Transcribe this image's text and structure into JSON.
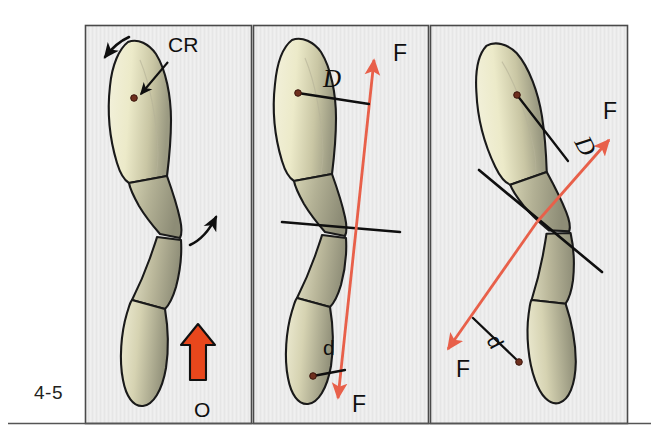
{
  "figure": {
    "number": "4-5",
    "background_color": "#ffffff",
    "panel_fill": "#ececec",
    "panel_border_color": "#4a4a4a",
    "rule_color": "#555555"
  },
  "colors": {
    "tooth_crown": "#ecead0",
    "tooth_shadow": "#9a9a82",
    "tooth_outline": "#1a1a1a",
    "force_arrow": "#e8604a",
    "occlusal_arrow": "#e8471c",
    "occlusal_arrow_outline": "#111111",
    "cr_dot": "#6e2f1e",
    "leader_line": "#111111",
    "axis_line": "#111111"
  },
  "panels": [
    {
      "id": "panel-1",
      "name": "panel-uprighting-moment",
      "labels": [
        {
          "key": "cr",
          "text": "CR",
          "style": "sans",
          "x": 168,
          "y": 52,
          "size": 21
        },
        {
          "key": "o",
          "text": "O",
          "style": "sans",
          "x": 194,
          "y": 417,
          "size": 21
        }
      ],
      "markers": [
        {
          "key": "cr-dot",
          "name": "center-of-resistance-dot",
          "x": 134,
          "y": 98
        }
      ],
      "arrows": [
        {
          "key": "rotation-top",
          "name": "rotation-arrow-top-left"
        },
        {
          "key": "rotation-bottom",
          "name": "rotation-arrow-bottom-right"
        },
        {
          "key": "occlusal-force",
          "name": "occlusal-force-arrow"
        }
      ]
    },
    {
      "id": "panel-2",
      "name": "panel-vertical-force",
      "labels": [
        {
          "key": "d-upper",
          "text": "D",
          "style": "serif-italic",
          "x": 323,
          "y": 87,
          "size": 25
        },
        {
          "key": "f-upper",
          "text": "F",
          "style": "sans",
          "x": 393,
          "y": 61,
          "size": 23
        },
        {
          "key": "d-lower",
          "text": "d",
          "style": "sans",
          "x": 323,
          "y": 355,
          "size": 21
        },
        {
          "key": "f-lower",
          "text": "F",
          "style": "sans",
          "x": 352,
          "y": 412,
          "size": 23
        }
      ],
      "markers": [
        {
          "key": "cr-dot-upper",
          "name": "center-of-resistance-dot-upper",
          "x": 298,
          "y": 93
        },
        {
          "key": "cr-dot-lower",
          "name": "center-of-resistance-dot-lower",
          "x": 313,
          "y": 376
        }
      ],
      "arrows": [
        {
          "key": "force-up",
          "name": "force-vector-upward"
        },
        {
          "key": "force-down",
          "name": "force-vector-downward"
        }
      ]
    },
    {
      "id": "panel-3",
      "name": "panel-angled-force",
      "labels": [
        {
          "key": "d-upper",
          "text": "D",
          "style": "serif-italic",
          "x": 574,
          "y": 142,
          "size": 25,
          "rotate": 62
        },
        {
          "key": "f-upper",
          "text": "F",
          "style": "sans",
          "x": 603,
          "y": 119,
          "size": 23
        },
        {
          "key": "d-lower",
          "text": "d",
          "style": "sans",
          "x": 486,
          "y": 340,
          "size": 21,
          "rotate": 62
        },
        {
          "key": "f-lower",
          "text": "F",
          "style": "sans",
          "x": 456,
          "y": 377,
          "size": 23
        }
      ],
      "markers": [
        {
          "key": "cr-dot-upper",
          "name": "center-of-resistance-dot-upper",
          "x": 517,
          "y": 95
        },
        {
          "key": "cr-dot-lower",
          "name": "center-of-resistance-dot-lower",
          "x": 519,
          "y": 362
        }
      ],
      "arrows": [
        {
          "key": "force-up-right",
          "name": "force-vector-up-right"
        },
        {
          "key": "force-down-left",
          "name": "force-vector-down-left"
        }
      ]
    }
  ]
}
